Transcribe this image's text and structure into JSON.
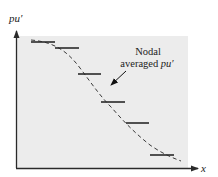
{
  "diagram": {
    "y_axis_label": "pu′",
    "x_axis_label": "x",
    "annotation_line1": "Nodal",
    "annotation_line2_prefix": "averaged ",
    "annotation_line2_var": "pu′",
    "colors": {
      "panel": "#ececec",
      "line": "#2a2a2a",
      "dashed": "#3a3a3a"
    },
    "nodal_bars": [
      {
        "x1": 31,
        "x2": 55,
        "y": 42
      },
      {
        "x1": 55,
        "x2": 79,
        "y": 48
      },
      {
        "x1": 78,
        "x2": 101,
        "y": 74
      },
      {
        "x1": 101,
        "x2": 125,
        "y": 102
      },
      {
        "x1": 126,
        "x2": 149,
        "y": 123
      },
      {
        "x1": 150,
        "x2": 174,
        "y": 155
      }
    ]
  }
}
